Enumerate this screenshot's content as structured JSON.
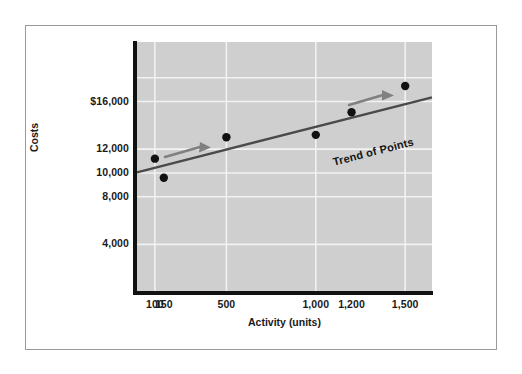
{
  "figure": {
    "background_color": "#ffffff",
    "frame_color": "#9a9a9a",
    "plot_background_color": "#cfcfcf",
    "gridline_color": "#f2f2f2",
    "axis_color": "#111111",
    "point_color": "#111111",
    "trendline_color": "#4a4a4a",
    "arrow_color": "#808080"
  },
  "chart_data": {
    "type": "scatter",
    "title": "",
    "subtitle": "",
    "xlabel": "Activity (units)",
    "ylabel": "Costs",
    "grid": true,
    "legend": "none",
    "xlim": [
      0,
      1650
    ],
    "ylim": [
      0,
      21000
    ],
    "xticks": [
      {
        "value": 100,
        "label": "100"
      },
      {
        "value": 150,
        "label": "150"
      },
      {
        "value": 500,
        "label": "500"
      },
      {
        "value": 1000,
        "label": "1,000"
      },
      {
        "value": 1200,
        "label": "1,200"
      },
      {
        "value": 1500,
        "label": "1,500"
      }
    ],
    "yticks": [
      {
        "value": 4000,
        "label": "4,000"
      },
      {
        "value": 8000,
        "label": "8,000"
      },
      {
        "value": 10000,
        "label": "10,000"
      },
      {
        "value": 12000,
        "label": "12,000"
      },
      {
        "value": 16000,
        "label": "$16,000"
      }
    ],
    "x_gridlines": [
      100,
      500,
      1000,
      1500
    ],
    "y_gridlines": [
      4000,
      8000,
      10000,
      12000,
      16000,
      18000
    ],
    "points": [
      {
        "x": 100,
        "y": 11200,
        "label": ""
      },
      {
        "x": 150,
        "y": 9600,
        "label": ""
      },
      {
        "x": 500,
        "y": 13000,
        "label": ""
      },
      {
        "x": 1000,
        "y": 13200,
        "label": ""
      },
      {
        "x": 1200,
        "y": 15100,
        "label": ""
      },
      {
        "x": 1500,
        "y": 17300,
        "label": ""
      }
    ],
    "trendline": {
      "label": "Trend of Points",
      "x_start": 0,
      "y_start": 10050,
      "x_end": 1650,
      "y_end": 16350
    },
    "annotations": [
      {
        "name": "trend-label",
        "text": "Trend of Points"
      },
      {
        "name": "direction-arrow-left",
        "text": ""
      },
      {
        "name": "direction-arrow-right",
        "text": ""
      }
    ]
  },
  "axis": {
    "y_title": "Costs",
    "x_title": "Activity (units)"
  }
}
